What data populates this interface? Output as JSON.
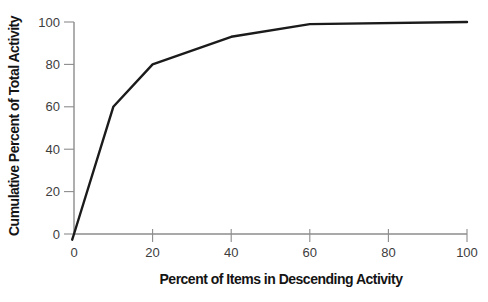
{
  "chart_data": {
    "type": "line",
    "title": "",
    "xlabel": "Percent of Items in Descending Activity",
    "ylabel": "Cumulative Percent of Total Activity",
    "x": [
      0,
      10,
      20,
      40,
      60,
      100
    ],
    "y": [
      0,
      60,
      80,
      93,
      99,
      100
    ],
    "series": [
      {
        "name": "cumulative-activity",
        "x": [
          0,
          10,
          20,
          40,
          60,
          100
        ],
        "values": [
          0,
          60,
          80,
          93,
          99,
          100
        ]
      }
    ],
    "xticks": [
      0,
      20,
      40,
      60,
      80,
      100
    ],
    "yticks": [
      0,
      20,
      40,
      60,
      80,
      100
    ],
    "xlim": [
      0,
      100
    ],
    "ylim": [
      0,
      100
    ],
    "grid": false,
    "legend": "none",
    "colors": {
      "curve": "#1b1b1b",
      "axis": "#8c8c8c",
      "tick_label": "#3d3d3d",
      "axis_title": "#141414",
      "background": "#ffffff"
    }
  }
}
